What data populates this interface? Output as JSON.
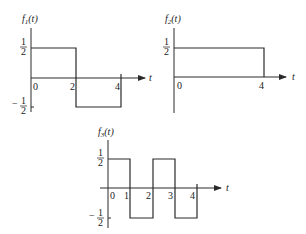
{
  "figure": {
    "plots": [
      {
        "id": "f1",
        "ylabel": "f",
        "ylabel_sub": "1",
        "ylabel_arg": "(t)",
        "xlabel": "t",
        "y_ticks": {
          "high": "1/2",
          "low": "−1/2"
        },
        "x_ticks": [
          "0",
          "2",
          "4"
        ],
        "segments": [
          {
            "t_start": 0,
            "t_end": 2,
            "value": 0.5
          },
          {
            "t_start": 2,
            "t_end": 4,
            "value": -0.5
          }
        ]
      },
      {
        "id": "f2",
        "ylabel": "f",
        "ylabel_sub": "2",
        "ylabel_arg": "(t)",
        "xlabel": "t",
        "y_ticks": {
          "high": "1/2"
        },
        "x_ticks": [
          "0",
          "4"
        ],
        "segments": [
          {
            "t_start": 0,
            "t_end": 4,
            "value": 0.5
          }
        ]
      },
      {
        "id": "f3",
        "ylabel": "f",
        "ylabel_sub": "3",
        "ylabel_arg": "(t)",
        "xlabel": "t",
        "y_ticks": {
          "high": "1/2",
          "low": "−1/2"
        },
        "x_ticks": [
          "0",
          "1",
          "2",
          "3",
          "4"
        ],
        "segments": [
          {
            "t_start": 0,
            "t_end": 1,
            "value": 0.5
          },
          {
            "t_start": 1,
            "t_end": 2,
            "value": -0.5
          },
          {
            "t_start": 2,
            "t_end": 3,
            "value": 0.5
          },
          {
            "t_start": 3,
            "t_end": 4,
            "value": -0.5
          }
        ]
      }
    ],
    "labels": {
      "half_num": "1",
      "half_den": "2",
      "minus": "−",
      "t0": "0",
      "t1": "1",
      "t2": "2",
      "t3": "3",
      "t4": "4"
    }
  }
}
